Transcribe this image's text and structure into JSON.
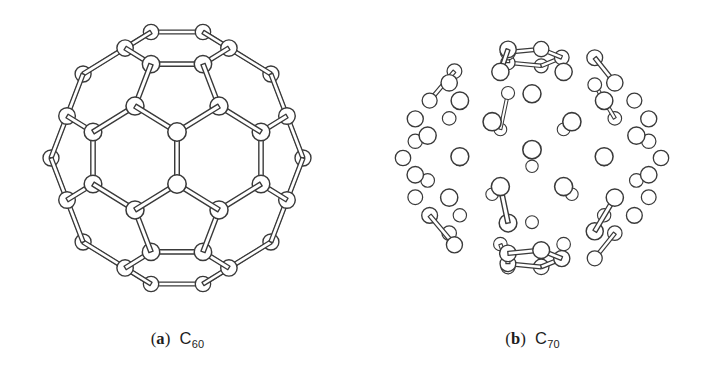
{
  "figure": {
    "background_color": "#ffffff",
    "line_color": "#3a3a3a",
    "atom_fill_color": "#ffffff",
    "width": 710,
    "height": 372
  },
  "panels": [
    {
      "id": "a",
      "open_paren": "(",
      "letter": "a",
      "close_paren": ")",
      "formula_element": "C",
      "formula_count": "60",
      "molecule_name": "C60",
      "structure_type": "truncated-icosahedron",
      "atom_count": 60,
      "bond_count": 90,
      "hexagon_faces": 20,
      "pentagon_faces": 12,
      "view_orientation": "down-hexagon-face"
    },
    {
      "id": "b",
      "open_paren": "(",
      "letter": "b",
      "close_paren": ")",
      "formula_element": "C",
      "formula_count": "70",
      "molecule_name": "C70",
      "structure_type": "elongated-fullerene",
      "atom_count": 70,
      "bond_count": 105,
      "hexagon_faces": 25,
      "pentagon_faces": 12,
      "view_orientation": "side-on-equatorial-belt"
    }
  ],
  "render": {
    "atom_radius_front": 9.2,
    "atom_radius_back": 6.2,
    "bond_half_width": 2.0,
    "stroke_width": 1.25
  }
}
